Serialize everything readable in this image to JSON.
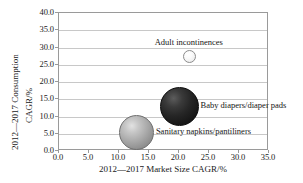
{
  "chart_data": {
    "type": "scatter",
    "title": "",
    "xlabel": "2012—2017 Market Size CAGR/%",
    "ylabel_line1": "2012—2017 Consumption",
    "ylabel_line2": "CAGR/%",
    "xlim": [
      0,
      35
    ],
    "ylim": [
      0,
      40
    ],
    "xticks": [
      "0.0",
      "5.0",
      "10.0",
      "15.0",
      "20.0",
      "25.0",
      "30.0",
      "35.0"
    ],
    "yticks": [
      "0.0",
      "5.0",
      "10.0",
      "15.0",
      "20.0",
      "25.0",
      "30.0",
      "35.0",
      "40.0"
    ],
    "xtick_values": [
      0,
      5,
      10,
      15,
      20,
      25,
      30,
      35
    ],
    "ytick_values": [
      0,
      5,
      10,
      15,
      20,
      25,
      30,
      35,
      40
    ],
    "grid": "horizontal",
    "legend": "none",
    "points": [
      {
        "name": "Adult incontinences",
        "label": "Adult incontinences",
        "x": 21.8,
        "y": 27.5,
        "size_px": 13,
        "color": "#f5f5f5",
        "label_position": "above"
      },
      {
        "name": "Baby diapers/diaper pads",
        "label": "Baby diapers/diaper pads",
        "x": 20.0,
        "y": 13.0,
        "size_px": 39,
        "color": "#262626",
        "label_position": "right"
      },
      {
        "name": "Sanitary napkins/pantiliners",
        "label": "Sanitary napkins/pantiliners",
        "x": 12.9,
        "y": 5.4,
        "size_px": 35,
        "color": "#ababab",
        "label_position": "right"
      }
    ]
  }
}
